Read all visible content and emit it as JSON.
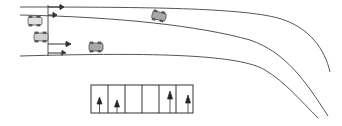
{
  "diagram": {
    "type": "road-lane-diagram",
    "colors": {
      "line": "#555555",
      "car_fill": "#b0b0b0",
      "car_fill_light": "#d8d8d8",
      "car_stroke": "#555555",
      "arrow": "#333333",
      "background": "#ffffff"
    },
    "lane_panel": {
      "cells": [
        {
          "arrow": "straight"
        },
        {
          "arrow": "straight"
        },
        {
          "arrow": "none"
        },
        {
          "arrow": "none"
        },
        {
          "arrow": "straight"
        },
        {
          "arrow": "straight"
        }
      ]
    },
    "vehicles": [
      {
        "id": "car-1",
        "label": ""
      },
      {
        "id": "car-2",
        "label": ""
      },
      {
        "id": "car-3",
        "label": ""
      },
      {
        "id": "car-4",
        "label": ""
      }
    ]
  }
}
